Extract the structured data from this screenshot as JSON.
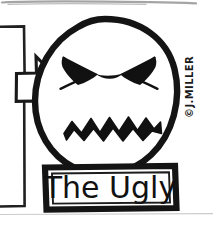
{
  "image": {
    "kind": "scanned-ink-cartoon",
    "width": 213,
    "height": 226,
    "background_color": "#ffffff",
    "ink_color": "#111111",
    "description": "Hand-drawn black ink cartoon of an angry round face above a labelled banner, with an arrow pointing in from the left edge"
  },
  "caption": {
    "label": "The Ugly",
    "banner_shape": "hand-drawn rectangle",
    "banner_fill": "#ffffff",
    "banner_stroke": "#111111"
  },
  "signature": {
    "label": "©J.MILLER",
    "orientation": "rotated-vertical-bottom-to-top",
    "color": "#1a1a1a"
  },
  "face": {
    "head_shape": "circle",
    "head_stroke": "#111111",
    "expression": "angry",
    "left_eye": "filled-angry-wedge",
    "right_eye": "filled-angry-wedge",
    "mouth": "zigzag-gritted-teeth"
  },
  "pointer": {
    "shape": "right-pointing-arrow",
    "bracket": "partial-rectangle-cropped-at-left-edge",
    "fill": "#ffffff",
    "stroke": "#111111"
  },
  "artifacts": {
    "top_smudge": "faint dark scan smudge along top edge",
    "bottom_line": "faint horizontal scan line near bottom edge"
  }
}
